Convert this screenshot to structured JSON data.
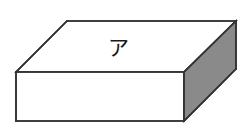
{
  "figure": {
    "shape_name": "rectangular-prism",
    "background_color": "#ffffff",
    "edge_color": "#333333",
    "labels": {
      "top_face": "ア"
    },
    "faces": [
      {
        "name": "top-face",
        "fill_color": "#ffffff",
        "points": "67,21 236,21 184,72 16,72",
        "label": "ア",
        "label_x": "118",
        "label_y": "55"
      },
      {
        "name": "front-face",
        "fill_color": "#ffffff",
        "points": "16,72 184,72 184,121 16,121"
      },
      {
        "name": "right-face",
        "fill_color": "#8a8a8a",
        "points": "236,21 236,69 184,121 184,72"
      }
    ],
    "edges": [
      {
        "name": "top-back-edge",
        "d": "M 67,21 L 236,21"
      },
      {
        "name": "top-left-edge",
        "d": "M 67,21 L 16,72"
      },
      {
        "name": "top-front-edge",
        "d": "M 16,72 L 184,72"
      },
      {
        "name": "top-right-edge",
        "d": "M 236,21 L 184,72"
      },
      {
        "name": "front-left-edge",
        "d": "M 16,72 L 16,121"
      },
      {
        "name": "front-bottom-edge",
        "d": "M 16,121 L 184,121"
      },
      {
        "name": "front-right-edge",
        "d": "M 184,72 L 184,121"
      },
      {
        "name": "right-back-edge",
        "d": "M 236,21 L 236,69"
      },
      {
        "name": "right-bottom-edge",
        "d": "M 236,69 L 184,121"
      }
    ]
  }
}
